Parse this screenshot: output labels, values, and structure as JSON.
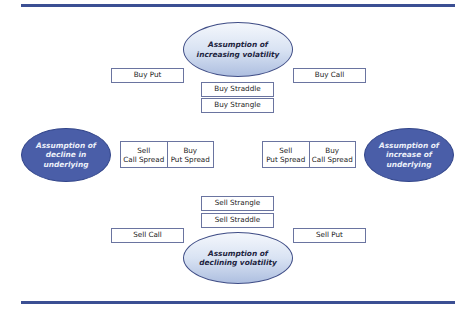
{
  "diagram": {
    "type": "option-strategy-map",
    "ellipses": {
      "top": "Assumption of\nincreasing volatility",
      "bottom": "Assumption of\ndeclining volatility",
      "left": "Assumption of\ndecline in\nunderlying",
      "right": "Assumption of\nincrease of\nunderlying"
    },
    "top_boxes": {
      "buy_put": "Buy Put",
      "buy_call": "Buy Call",
      "buy_straddle": "Buy Straddle",
      "buy_strangle": "Buy Strangle"
    },
    "bottom_boxes": {
      "sell_strangle": "Sell Strangle",
      "sell_straddle": "Sell Straddle",
      "sell_call": "Sell Call",
      "sell_put": "Sell Put"
    },
    "left_pair": {
      "a": "Sell\nCall Spread",
      "b": "Buy\nPut Spread"
    },
    "right_pair": {
      "a": "Sell\nPut Spread",
      "b": "Buy\nCall Spread"
    },
    "colors": {
      "rule": "#3b4f93",
      "dark_ellipse": "#4a5ea8",
      "light_ellipse_bottom": "#aebfe0",
      "box_border": "#6a74a0"
    }
  }
}
